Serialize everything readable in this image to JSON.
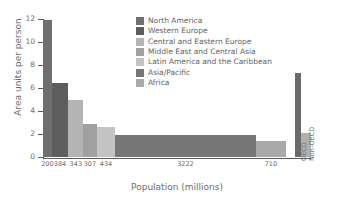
{
  "chart_data": {
    "type": "bar",
    "title": "",
    "subtitle": "",
    "xlabel": "Population (millions)",
    "ylabel": "Area units per person",
    "ylim": [
      0,
      12
    ],
    "yticks": [
      0,
      2,
      4,
      6,
      8,
      10,
      12
    ],
    "grid": false,
    "legend_position": "top-center",
    "note": "Variable-width bar chart: bar width is proportional to population (millions); bar height is area units per person.",
    "categories": [
      "North America",
      "Western Europe",
      "Central and Eastern Europe",
      "Middle East and Central Asia",
      "Latin America and the Caribbean",
      "Asia/Pacific",
      "Africa"
    ],
    "widths": [
      200,
      384,
      343,
      307,
      434,
      3222,
      710
    ],
    "values": [
      11.9,
      6.4,
      5.0,
      2.85,
      2.6,
      1.95,
      1.4
    ],
    "xtick_labels": [
      "200",
      "384",
      "343",
      "307",
      "434",
      "3222",
      "710"
    ],
    "aggregate": {
      "categories": [
        "OECD",
        "Non-OECD"
      ],
      "values": [
        7.3,
        2.05
      ],
      "widths": [
        120,
        240
      ]
    },
    "colors": [
      "#6f6f6f",
      "#5e5e5e",
      "#b4b4b4",
      "#a0a0a0",
      "#c3c3c3",
      "#767676",
      "#a9a9a9"
    ],
    "aggregate_colors": [
      "#6a6a6a",
      "#b0b0b0"
    ]
  },
  "legend": {
    "items": [
      {
        "label": "North America",
        "color": "#6f6f6f"
      },
      {
        "label": "Western Europe",
        "color": "#5e5e5e"
      },
      {
        "label": "Central and Eastern Europe",
        "color": "#b4b4b4"
      },
      {
        "label": "Middle East and Central Asia",
        "color": "#a0a0a0"
      },
      {
        "label": "Latin America and the Caribbean",
        "color": "#c3c3c3"
      },
      {
        "label": "Asia/Pacific",
        "color": "#767676"
      },
      {
        "label": "Africa",
        "color": "#a9a9a9"
      }
    ]
  },
  "axes": {
    "y_title": "Area units per person",
    "x_title": "Population (millions)",
    "y_tick_labels": [
      "0",
      "2",
      "4",
      "6",
      "8",
      "10",
      "12"
    ],
    "x_tick_labels": [
      "200",
      "384",
      "343",
      "307",
      "434",
      "3222",
      "710"
    ],
    "x_aggregate_labels": [
      "OECD",
      "Non-OECD"
    ]
  },
  "style": {
    "background": "#ffffff",
    "axis_color": "#5a5a5a",
    "text_color": "#6d6d6d"
  }
}
